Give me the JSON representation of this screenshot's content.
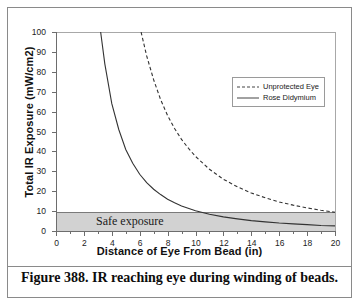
{
  "figure": {
    "caption": "Figure 388. IR reaching eye during winding of beads."
  },
  "annotations": {
    "safe_exposure_label": "Safe exposure"
  },
  "colors": {
    "band_fill": "#d2d2d2",
    "axis": "#6d6d6d",
    "curve": "#333333",
    "frame": "#8a8a8a"
  },
  "chart_data": {
    "type": "line",
    "title": "",
    "xlabel": "Distance of Eye From Bead (in)",
    "ylabel": "Total IR Exposure (mW/cm2)",
    "xlim": [
      0,
      20
    ],
    "ylim": [
      0,
      100
    ],
    "xticks": [
      0,
      2,
      4,
      6,
      8,
      10,
      12,
      14,
      16,
      18,
      20
    ],
    "xticks_minor": [
      1,
      3,
      5,
      7,
      9,
      11,
      13,
      15,
      17,
      19
    ],
    "yticks": [
      0,
      10,
      20,
      30,
      40,
      50,
      60,
      70,
      80,
      90,
      100
    ],
    "grid": false,
    "legend_position": "upper right",
    "shaded_region": {
      "label": "Safe exposure",
      "y_from": 0,
      "y_to": 10,
      "fill": "#d2d2d2"
    },
    "series": [
      {
        "name": "Unprotected Eye",
        "style": "dashed",
        "x": [
          6.1,
          6.5,
          7,
          7.5,
          8,
          8.5,
          9,
          9.5,
          10,
          11,
          12,
          13,
          14,
          15,
          16,
          17,
          18,
          19,
          20
        ],
        "values": [
          100,
          88,
          76,
          66,
          58,
          51.5,
          46,
          41.5,
          37.5,
          31,
          26,
          22.2,
          19.1,
          16.7,
          14.6,
          13,
          11.6,
          10.4,
          9.4
        ]
      },
      {
        "name": "Rose Didymium",
        "style": "solid",
        "x": [
          3.2,
          3.5,
          4,
          4.5,
          5,
          5.5,
          6,
          6.5,
          7,
          7.5,
          8,
          8.5,
          9,
          10,
          11,
          12,
          13,
          14,
          15,
          16,
          17,
          18,
          19,
          20
        ],
        "values": [
          100,
          84,
          64,
          51,
          41,
          34,
          28.5,
          24.3,
          21,
          18.3,
          16,
          14.2,
          12.6,
          10.2,
          8.4,
          7.1,
          6.1,
          5.2,
          4.6,
          4,
          3.6,
          3.2,
          2.8,
          2.6
        ]
      }
    ]
  },
  "legend": {
    "items": [
      {
        "label": "Unprotected Eye",
        "style": "dashed"
      },
      {
        "label": "Rose Didymium",
        "style": "solid"
      }
    ]
  }
}
